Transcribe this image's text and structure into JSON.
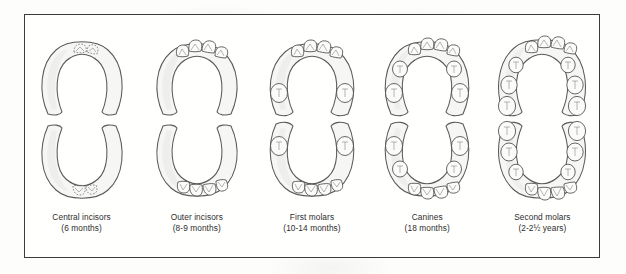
{
  "figure": {
    "frame_color": "#3b3b3b",
    "background_color": "#fdfdfc",
    "columns": [
      {
        "id": "central-incisors",
        "caption_line1": "Central incisors",
        "caption_line2": "(6 months)",
        "upper_teeth": 2,
        "lower_teeth": 2,
        "newly_erupted": true
      },
      {
        "id": "outer-incisors",
        "caption_line1": "Outer incisors",
        "caption_line2": "(8-9 months)",
        "upper_teeth": 4,
        "lower_teeth": 4,
        "newly_erupted": false
      },
      {
        "id": "first-molars",
        "caption_line1": "First molars",
        "caption_line2": "(10-14 months)",
        "upper_teeth": 6,
        "lower_teeth": 6,
        "newly_erupted": false
      },
      {
        "id": "canines",
        "caption_line1": "Canines",
        "caption_line2": "(18 months)",
        "upper_teeth": 8,
        "lower_teeth": 8,
        "newly_erupted": false
      },
      {
        "id": "second-molars",
        "caption_line1": "Second molars",
        "caption_line2": "(2-2½ years)",
        "upper_teeth": 10,
        "lower_teeth": 10,
        "newly_erupted": false
      }
    ]
  }
}
